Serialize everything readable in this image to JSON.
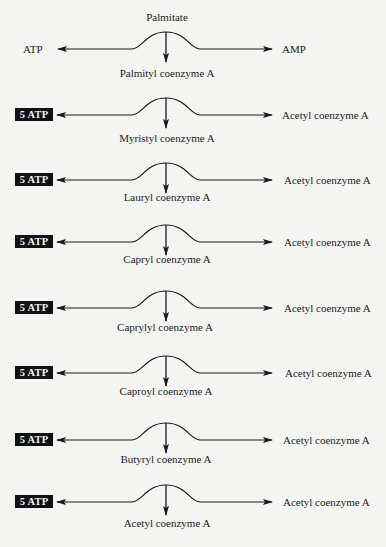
{
  "diagram": {
    "start_substrate": "Palmitate",
    "steps": [
      {
        "left_label": "ATP",
        "left_boxed": false,
        "right_label": "AMP",
        "product": "Palmityl coenzyme A"
      },
      {
        "left_label": "5 ATP",
        "left_boxed": true,
        "right_label": "Acetyl coenzyme A",
        "product": "Myristyl coenzyme A"
      },
      {
        "left_label": "5 ATP",
        "left_boxed": true,
        "right_label": "Acetyl coenzyme A",
        "product": "Lauryl coenzyme A"
      },
      {
        "left_label": "5 ATP",
        "left_boxed": true,
        "right_label": "Acetyl coenzyme A",
        "product": "Capryl coenzyme A"
      },
      {
        "left_label": "5 ATP",
        "left_boxed": true,
        "right_label": "Acetyl coenzyme A",
        "product": "Caprylyl coenzyme A"
      },
      {
        "left_label": "5 ATP",
        "left_boxed": true,
        "right_label": "Acetyl coenzyme A",
        "product": "Caproyl coenzyme A"
      },
      {
        "left_label": "5 ATP",
        "left_boxed": true,
        "right_label": "Acetyl coenzyme A",
        "product": "Butyryl coenzyme A"
      },
      {
        "left_label": "5 ATP",
        "left_boxed": true,
        "right_label": "Acetyl coenzyme A",
        "product": "Acetyl coenzyme A"
      }
    ],
    "colors": {
      "background": "#f4f4f2",
      "ink": "#1a1a1a",
      "box_fill": "#111111",
      "box_text": "#f5f5f5"
    }
  }
}
